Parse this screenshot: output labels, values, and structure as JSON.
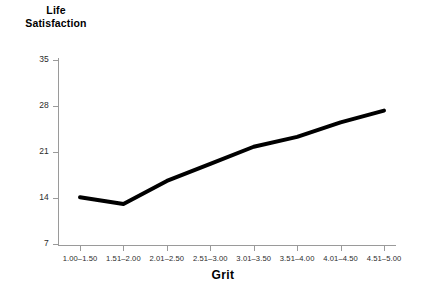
{
  "chart_data": {
    "type": "line",
    "title": "",
    "xlabel": "Grit",
    "ylabel": "Life Satisfaction",
    "ylabel_lines": [
      "Life",
      "Satisfaction"
    ],
    "categories": [
      "1.00–1.50",
      "1.51–2.00",
      "2.01–2.50",
      "2.51–3.00",
      "3.01–3.50",
      "3.51–4.00",
      "4.01–4.50",
      "4.51–5.00"
    ],
    "values": [
      14.1,
      13.1,
      16.6,
      19.2,
      21.8,
      23.3,
      25.5,
      27.3
    ],
    "series": [
      {
        "name": "Life Satisfaction",
        "values": [
          14.1,
          13.1,
          16.6,
          19.2,
          21.8,
          23.3,
          25.5,
          27.3
        ],
        "color": "#000000",
        "line_width": 4
      }
    ],
    "yticks": [
      7,
      14,
      21,
      28,
      35
    ],
    "ytick_labels": [
      "7",
      "14",
      "21",
      "28",
      "35"
    ],
    "ylim": [
      7,
      35
    ],
    "xlim": [
      0,
      7
    ],
    "grid": false,
    "legend": false,
    "legend_position": "none",
    "background_color": "#ffffff",
    "axis_color": "#9a9a9a",
    "text_color": "#1a1a1a",
    "markers": false
  },
  "axes": {
    "y_title_line1": "Life",
    "y_title_line2": "Satisfaction",
    "x_title": "Grit"
  }
}
